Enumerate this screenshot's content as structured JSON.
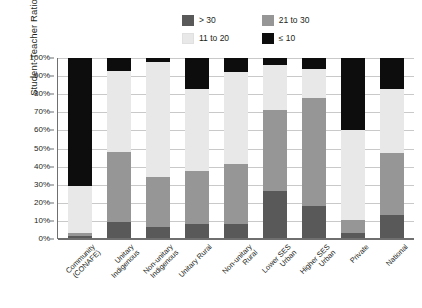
{
  "chart_data": {
    "type": "bar",
    "subtype": "stacked-percent",
    "title": "",
    "xlabel": "",
    "ylabel": "Student-Teacher Ratio",
    "ylim": [
      0,
      100
    ],
    "ytick_labels": [
      "0%",
      "10%",
      "20%",
      "30%",
      "40%",
      "50%",
      "60%",
      "70%",
      "80%",
      "90%",
      "100%"
    ],
    "ytick_values": [
      0,
      10,
      20,
      30,
      40,
      50,
      60,
      70,
      80,
      90,
      100
    ],
    "grid": true,
    "legend_position": "top",
    "categories": [
      "Community (CONAFE)",
      "Unitary Indigenous",
      "Non-unitary Indigenous",
      "Unitary Rural",
      "Non-unitary Rural",
      "Lower SES Urban",
      "Higher SES Urban",
      "Private",
      "National"
    ],
    "series": [
      {
        "name": "≤ 10",
        "color": "#0d0d0d",
        "values": [
          71,
          7,
          2,
          17,
          8,
          4,
          6,
          40,
          17
        ]
      },
      {
        "name": "11 to 20",
        "color": "#e8e8e8",
        "values": [
          26,
          45,
          64,
          46,
          51,
          25,
          16,
          50,
          36
        ]
      },
      {
        "name": "21 to 30",
        "color": "#969696",
        "values": [
          2,
          39,
          28,
          29,
          33,
          45,
          60,
          7,
          34
        ]
      },
      {
        "name": "> 30",
        "color": "#595959",
        "values": [
          1,
          9,
          6,
          8,
          8,
          26,
          18,
          3,
          13
        ]
      }
    ]
  },
  "legend": {
    "entries": [
      {
        "label": "> 30",
        "color": "#595959"
      },
      {
        "label": "21 to 30",
        "color": "#969696"
      },
      {
        "label": "11 to 20",
        "color": "#e8e8e8"
      },
      {
        "label": "≤ 10",
        "color": "#0d0d0d"
      }
    ]
  },
  "colors": {
    "axis": "#6f6f6f",
    "grid": "#c9c9c9",
    "text": "#231f20",
    "background": "#ffffff"
  }
}
